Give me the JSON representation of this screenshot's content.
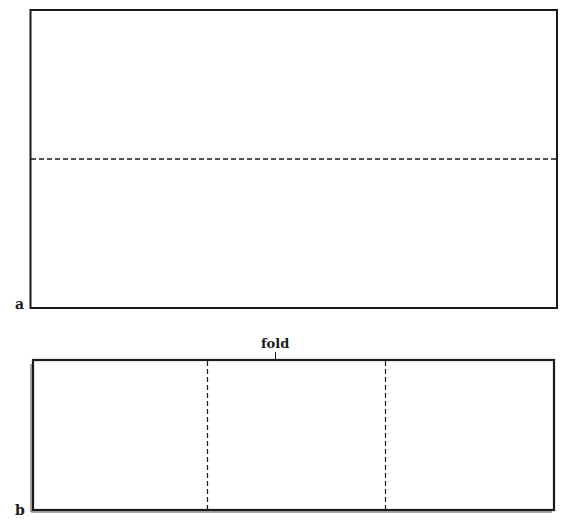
{
  "figure": {
    "panel_a": {
      "label": "a",
      "description": "rectangular sheet with horizontal dashed fold line at mid-height"
    },
    "panel_b": {
      "label": "b",
      "annotation": "fold",
      "description": "sheet folded in half, with two vertical dashed lines dividing it into thirds"
    }
  },
  "colors": {
    "line": "#1a1a1a",
    "background": "#ffffff"
  }
}
